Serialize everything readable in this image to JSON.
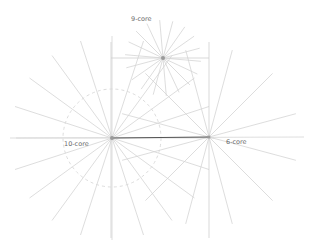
{
  "diagram": {
    "nodes": [
      {
        "id": "ten",
        "label": "10-core",
        "rays": 20
      },
      {
        "id": "six",
        "label": "6-core",
        "rays": 12
      },
      {
        "id": "nine",
        "label": "9-core",
        "rays": 18
      }
    ],
    "colors": {
      "ray": "#d4d4d4",
      "guide": "#cfcfcf",
      "dashed_circle": "#d8d8d8",
      "link": "#555555",
      "label": "#6a6a6a",
      "center": "#9a9a9a"
    }
  }
}
